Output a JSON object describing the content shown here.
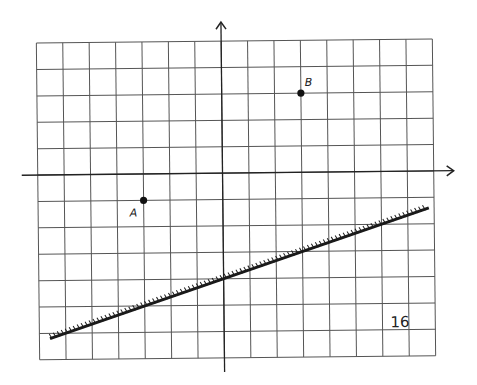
{
  "diagram": {
    "type": "coordinate-grid",
    "grid": {
      "columns": 15,
      "rows": 12,
      "cell_px": 26.4,
      "origin_col": 7,
      "origin_row": 5,
      "rotation_deg": -0.6
    },
    "colors": {
      "grid": "#555555",
      "axis": "#222222",
      "line": "#1a1a1a",
      "point": "#111111"
    },
    "points": [
      {
        "label": "A",
        "x": -3,
        "y": -1
      },
      {
        "label": "B",
        "x": 3,
        "y": 3
      }
    ],
    "line": {
      "description": "hatched line",
      "slope": 0.3333,
      "intercept": -4,
      "x_from": -6.6,
      "x_to": 7.8,
      "hatched": true
    },
    "page_number": "16"
  }
}
